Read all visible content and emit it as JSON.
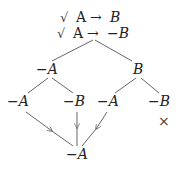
{
  "premises": [
    {
      "check": "√",
      "formula_left": "A",
      "arrow": "→",
      "formula_right": "B"
    },
    {
      "check": "√",
      "formula_left": "A",
      "arrow": "→",
      "formula_right": "−B"
    }
  ],
  "tree": {
    "level1": [
      {
        "label": "−A",
        "id": "n1"
      },
      {
        "label": "B",
        "id": "n2"
      }
    ],
    "level2": [
      {
        "label": "−A",
        "id": "n3",
        "parent": "n1"
      },
      {
        "label": "−B",
        "id": "n4",
        "parent": "n1"
      },
      {
        "label": "−A",
        "id": "n5",
        "parent": "n2"
      },
      {
        "label": "−B",
        "id": "n6",
        "parent": "n2"
      }
    ],
    "closed_marker": "×",
    "conclusion": {
      "label": "−A",
      "id": "n7"
    }
  }
}
